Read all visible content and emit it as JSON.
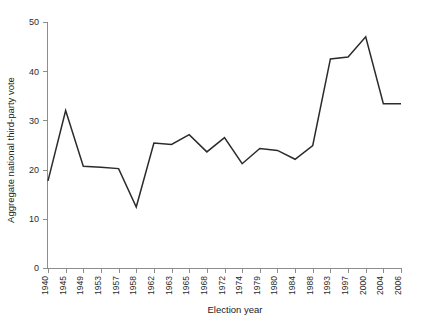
{
  "chart_data": {
    "type": "line",
    "title": "",
    "xlabel": "Election year",
    "ylabel": "Aggregate national third-party vote",
    "categories": [
      "1940",
      "1945",
      "1949",
      "1953",
      "1957",
      "1958",
      "1962",
      "1963",
      "1965",
      "1968",
      "1972",
      "1974",
      "1979",
      "1980",
      "1984",
      "1988",
      "1993",
      "1997",
      "2000",
      "2004",
      "2006"
    ],
    "values": [
      17.7,
      32.0,
      20.7,
      20.5,
      20.2,
      12.4,
      25.4,
      25.1,
      27.1,
      23.6,
      26.5,
      21.2,
      24.3,
      23.9,
      22.1,
      24.9,
      42.5,
      42.9,
      47.0,
      33.4,
      33.4
    ],
    "ylim": [
      0,
      50
    ],
    "yticks": [
      0,
      10,
      20,
      30,
      40,
      50
    ],
    "ytick_labels": [
      "0",
      "10",
      "20",
      "30",
      "40",
      "50"
    ],
    "grid": false,
    "legend": false,
    "line_color": "#2b2b2b",
    "axis_color": "#8d8d8d"
  }
}
